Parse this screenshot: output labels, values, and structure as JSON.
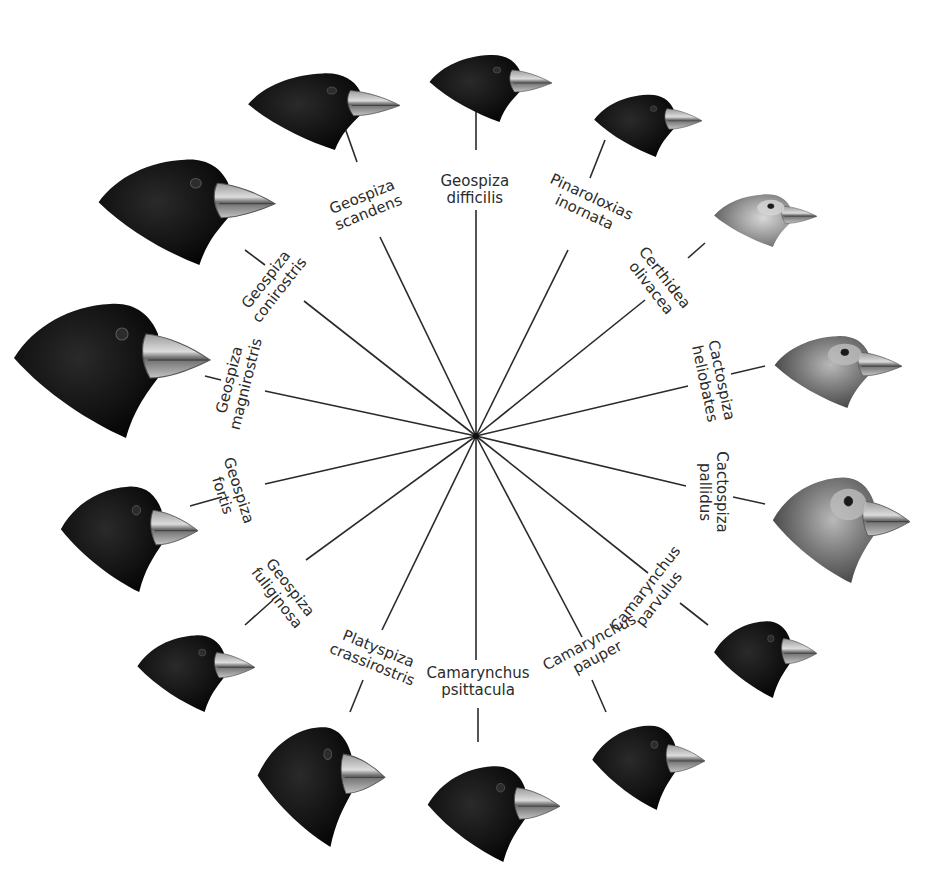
{
  "diagram": {
    "center": [
      476,
      436
    ],
    "colors": {
      "line": "#2a2a2a",
      "dark_plumage": "#141414",
      "grey_plumage": "#5e5e5e",
      "beak": "#b8b8b8",
      "text": "#2b2b2b"
    },
    "species": [
      {
        "genus": "Geospiza",
        "epithet": "difficilis",
        "label_x": 475,
        "label_y": 190,
        "rot": 0,
        "inner": [
          476,
          210
        ],
        "outer_a": [
          476,
          150
        ],
        "outer_b": [
          476,
          100
        ],
        "bird": {
          "x": 427,
          "y": 52,
          "w": 125,
          "h": 70,
          "tone": "dark"
        }
      },
      {
        "genus": "Geospiza",
        "epithet": "scandens",
        "label_x": 365,
        "label_y": 205,
        "rot": -22,
        "inner": [
          380,
          237
        ],
        "outer_a": [
          357,
          162
        ],
        "outer_b": [
          345,
          128
        ],
        "bird": {
          "x": 245,
          "y": 70,
          "w": 155,
          "h": 80,
          "tone": "dark"
        }
      },
      {
        "genus": "Geospiza",
        "epithet": "conirostris",
        "label_x": 273,
        "label_y": 285,
        "rot": -52,
        "inner": [
          304,
          301
        ],
        "outer_a": [
          265,
          265
        ],
        "outer_b": [
          245,
          250
        ],
        "bird": {
          "x": 95,
          "y": 155,
          "w": 180,
          "h": 110,
          "tone": "dark"
        }
      },
      {
        "genus": "Geospiza",
        "epithet": "magnirostris",
        "label_x": 238,
        "label_y": 382,
        "rot": -76,
        "inner": [
          265,
          391
        ],
        "outer_a": [
          221,
          380
        ],
        "outer_b": [
          205,
          376
        ],
        "bird": {
          "x": 10,
          "y": 298,
          "w": 200,
          "h": 140,
          "tone": "dark"
        }
      },
      {
        "genus": "Geospiza",
        "epithet": "fortis",
        "label_x": 230,
        "label_y": 493,
        "rot": 72,
        "inner": [
          265,
          484
        ],
        "outer_a": [
          222,
          497
        ],
        "outer_b": [
          190,
          506
        ],
        "bird": {
          "x": 58,
          "y": 482,
          "w": 140,
          "h": 110,
          "tone": "dark"
        }
      },
      {
        "genus": "Geospiza",
        "epithet": "fuliginosa",
        "label_x": 283,
        "label_y": 593,
        "rot": 52,
        "inner": [
          306,
          560
        ],
        "outer_a": [
          273,
          600
        ],
        "outer_b": [
          245,
          625
        ],
        "bird": {
          "x": 135,
          "y": 632,
          "w": 120,
          "h": 80,
          "tone": "dark"
        }
      },
      {
        "genus": "Platyspiza",
        "epithet": "crassirostris",
        "label_x": 375,
        "label_y": 657,
        "rot": 22,
        "inner": [
          382,
          630
        ],
        "outer_a": [
          363,
          680
        ],
        "outer_b": [
          350,
          712
        ],
        "bird": {
          "x": 255,
          "y": 722,
          "w": 130,
          "h": 125,
          "tone": "dark"
        }
      },
      {
        "genus": "Camarynchus",
        "epithet": "psittacula",
        "label_x": 478,
        "label_y": 682,
        "rot": 0,
        "inner": [
          476,
          660
        ],
        "outer_a": [
          478,
          708
        ],
        "outer_b": [
          478,
          742
        ],
        "bird": {
          "x": 425,
          "y": 762,
          "w": 135,
          "h": 100,
          "tone": "dark"
        }
      },
      {
        "genus": "Camarynchus",
        "epithet": "pauper",
        "label_x": 593,
        "label_y": 650,
        "rot": -28,
        "inner": [
          582,
          637
        ],
        "outer_a": [
          592,
          680
        ],
        "outer_b": [
          606,
          712
        ],
        "bird": {
          "x": 590,
          "y": 722,
          "w": 115,
          "h": 88,
          "tone": "dark"
        }
      },
      {
        "genus": "Camarynchus",
        "epithet": "parvulus",
        "label_x": 652,
        "label_y": 594,
        "rot": -52,
        "inner": [
          648,
          573
        ],
        "outer_a": [
          680,
          603
        ],
        "outer_b": [
          708,
          625
        ],
        "bird": {
          "x": 712,
          "y": 618,
          "w": 105,
          "h": 80,
          "tone": "dark"
        }
      },
      {
        "genus": "Cactospiza",
        "epithet": "pallidus",
        "label_x": 713,
        "label_y": 492,
        "rot": 90,
        "inner": [
          686,
          486
        ],
        "outer_a": [
          733,
          497
        ],
        "outer_b": [
          765,
          504
        ],
        "bird": {
          "x": 770,
          "y": 473,
          "w": 140,
          "h": 110,
          "tone": "grey"
        }
      },
      {
        "genus": "Cactospiza",
        "epithet": "heliobates",
        "label_x": 713,
        "label_y": 382,
        "rot": 78,
        "inner": [
          688,
          386
        ],
        "outer_a": [
          731,
          374
        ],
        "outer_b": [
          765,
          366
        ],
        "bird": {
          "x": 772,
          "y": 333,
          "w": 130,
          "h": 75,
          "tone": "grey"
        }
      },
      {
        "genus": "Certhidea",
        "epithet": "olivacea",
        "label_x": 657,
        "label_y": 283,
        "rot": 52,
        "inner": [
          645,
          300
        ],
        "outer_a": [
          688,
          258
        ],
        "outer_b": [
          705,
          243
        ],
        "bird": {
          "x": 712,
          "y": 192,
          "w": 105,
          "h": 55,
          "tone": "light"
        }
      },
      {
        "genus": "Pinaroloxias",
        "epithet": "inornata",
        "label_x": 588,
        "label_y": 205,
        "rot": 25,
        "inner": [
          568,
          250
        ],
        "outer_a": [
          590,
          178
        ],
        "outer_b": [
          605,
          140
        ],
        "bird": {
          "x": 592,
          "y": 92,
          "w": 110,
          "h": 65,
          "tone": "dark"
        }
      }
    ]
  }
}
